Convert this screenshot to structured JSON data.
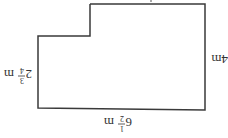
{
  "diagram": {
    "type": "rectilinear-shape",
    "orientation": "rotated-180",
    "stroke_color": "#3a3a3a",
    "labels": {
      "long_side": {
        "whole": "6",
        "num": "1",
        "den": "2",
        "unit": "m"
      },
      "short_side": {
        "value": "4m"
      },
      "step_side": {
        "whole": "2",
        "num": "3",
        "den": "4",
        "unit": "m"
      }
    }
  }
}
